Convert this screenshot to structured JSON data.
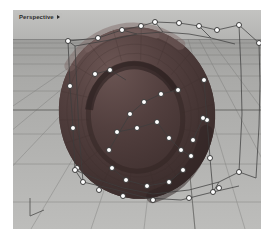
{
  "viewport": {
    "title": "Perspective",
    "caret_icon": "chevron-down-icon",
    "display_mode": "shaded",
    "background_color": "#b9b9b7",
    "sky_color": "#c3c3c1",
    "ground_color": "#a9a9a7",
    "grid_line_color": "#6e6e6c",
    "axis_indicator": "origin-axis-icon"
  },
  "model": {
    "object_name": "ring-torus",
    "surface_color": "#4a3a38",
    "surface_highlight": "#6a5654",
    "isocurve_color": "#3a2d2c",
    "control_points_visible": true,
    "control_point_fill": "#ffffff",
    "control_point_stroke": "#2b2b2b",
    "cage_line_color": "#3d3d3d",
    "control_point_count": 45
  },
  "chart_data": {
    "type": "scatter",
    "title": "Perspective",
    "xlabel": "",
    "ylabel": "",
    "grid": true,
    "legend": "none",
    "xlim": [
      0,
      248
    ],
    "ylim": [
      0,
      219
    ],
    "series": [
      {
        "name": "control-points",
        "x": [
          142,
          128,
          109,
          85,
          186,
          204,
          226,
          166,
          246,
          55,
          57,
          60,
          64,
          191,
          194,
          197,
          200,
          62,
          70,
          86,
          110,
          140,
          176,
          206,
          226,
          165,
          148,
          131,
          117,
          104,
          96,
          99,
          113,
          134,
          156,
          170,
          180,
          190,
          124,
          144,
          156,
          168,
          178,
          97,
          82
        ],
        "y": [
          12,
          16,
          20,
          28,
          16,
          20,
          15,
          13,
          33,
          31,
          76,
          118,
          158,
          70,
          110,
          148,
          182,
          160,
          172,
          180,
          186,
          190,
          188,
          178,
          162,
          80,
          84,
          92,
          104,
          122,
          140,
          158,
          170,
          176,
          172,
          160,
          130,
          108,
          118,
          112,
          128,
          140,
          146,
          60,
          64
        ]
      }
    ]
  }
}
